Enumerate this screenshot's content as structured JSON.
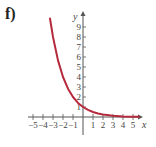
{
  "panel_label": "f)",
  "colors": {
    "curve": "#b52a3c",
    "axis": "#555555",
    "text": "#444444"
  },
  "chart_data": {
    "type": "line",
    "title": "",
    "xlabel": "x",
    "ylabel": "y",
    "xlim": [
      -5.5,
      5.7
    ],
    "ylim": [
      -1.8,
      10.3
    ],
    "grid": false,
    "legend": null,
    "x_ticks": [
      -5,
      -4,
      -3,
      -2,
      -1,
      1,
      2,
      3,
      4,
      5
    ],
    "x_tick_labels": [
      "-5",
      "-4",
      "-3",
      "-2",
      "-1",
      "1",
      "2",
      "3",
      "4",
      "5"
    ],
    "y_ticks": [
      1,
      2,
      3,
      4,
      5,
      6,
      7,
      8,
      9
    ],
    "y_tick_labels": [
      "1",
      "2",
      "3",
      "4",
      "5",
      "6",
      "7",
      "8",
      "9"
    ],
    "series": [
      {
        "name": "y = (1/2)^x",
        "x": [
          -3.3,
          -3,
          -2.5,
          -2,
          -1.5,
          -1,
          -0.5,
          0,
          0.5,
          1,
          1.5,
          2,
          3,
          4,
          5,
          5.6
        ],
        "y": [
          9.85,
          8,
          5.66,
          4,
          2.83,
          2,
          1.41,
          1,
          0.71,
          0.5,
          0.35,
          0.25,
          0.125,
          0.06,
          0.03,
          0.02
        ]
      }
    ]
  }
}
